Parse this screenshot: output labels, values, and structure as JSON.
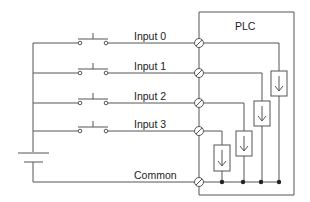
{
  "diagram": {
    "title": "PLC",
    "inputs": [
      {
        "label": "Input 0"
      },
      {
        "label": "Input 1"
      },
      {
        "label": "Input 2"
      },
      {
        "label": "Input 3"
      }
    ],
    "common_label": "Common",
    "components": {
      "switches": "normally-open pushbutton",
      "source": "battery",
      "sensing_elements": "current-sink input boxes with down arrow"
    },
    "colors": {
      "line": "#555555",
      "text": "#222222",
      "background": "#ffffff"
    }
  }
}
